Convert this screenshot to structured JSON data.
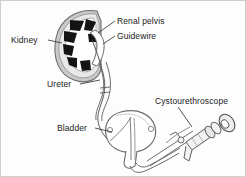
{
  "figure": {
    "background_color": "#fdfdfd",
    "border_color": "#c8c8c8",
    "ink_color": "#3b3b3b",
    "label_color": "#1b1b1b"
  },
  "labels": {
    "kidney": "Kidney",
    "ureter": "Ureter",
    "renal_pelvis": "Renal pelvis",
    "guidewire": "Guidewire",
    "bladder": "Bladder",
    "cystourethroscope": "Cystourethroscope"
  },
  "structures": [
    {
      "name": "kidney",
      "label": "Kidney",
      "fill": "#b9b9b9",
      "detail": "renal pyramids shown as black wedges around a white renal pelvis"
    },
    {
      "name": "renal-pelvis",
      "label": "Renal pelvis",
      "fill": "#ffffff"
    },
    {
      "name": "ureter",
      "label": "Ureter",
      "fill": "#ffffff"
    },
    {
      "name": "bladder",
      "label": "Bladder",
      "fill": "#ffffff"
    },
    {
      "name": "guidewire",
      "label": "Guidewire",
      "fill": "none"
    },
    {
      "name": "cystourethroscope",
      "label": "Cystourethroscope",
      "fill": "#efefef"
    }
  ]
}
